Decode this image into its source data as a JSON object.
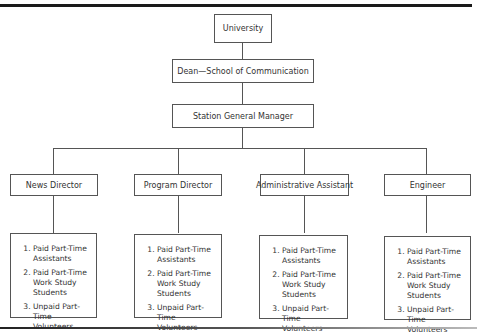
{
  "chart": {
    "top": {
      "label": "University"
    },
    "level1": {
      "label": "Dean—School of Communication"
    },
    "level2": {
      "label": "Station General Manager"
    },
    "departments": [
      {
        "label": "News Director",
        "staff": [
          "Paid Part-Time Assistants",
          "Paid Part-Time Work Study Students",
          "Unpaid Part-Time Volunteers"
        ]
      },
      {
        "label": "Program Director",
        "staff": [
          "Paid Part-Time Assistants",
          "Paid Part-Time Work Study Students",
          "Unpaid Part-Time Volunteers"
        ]
      },
      {
        "label": "Administrative Assistant",
        "staff": [
          "Paid Part-Time Assistants",
          "Paid Part-Time Work Study Students",
          "Unpaid Part-Time Volunteers"
        ]
      },
      {
        "label": "Engineer",
        "staff": [
          "Paid Part-Time Assistants",
          "Paid Part-Time Work Study Students",
          "Unpaid Part-Time Volunteers"
        ]
      }
    ]
  },
  "colors": {
    "line": "#555555",
    "text": "#333333",
    "rule": "#1a1a1a"
  }
}
